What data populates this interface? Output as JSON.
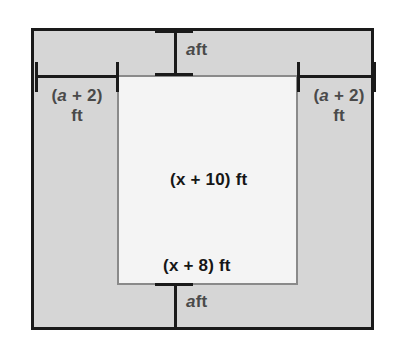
{
  "figure": {
    "colors": {
      "outer_fill": "#d6d6d6",
      "outer_border": "#1a1a1a",
      "inner_fill": "#f4f4f4",
      "inner_border": "#8a8a8a",
      "dimension_line": "#1a1a1a",
      "outer_label_text": "#4a4a4a",
      "inner_label_text": "#161616",
      "page_background": "#ffffff"
    },
    "labels": {
      "top_border": {
        "var": "a",
        "unit": "ft"
      },
      "bottom_border": {
        "var": "a",
        "unit": "ft"
      },
      "left_border": {
        "expr": "(a + 2)",
        "expr_open": "(",
        "expr_var": "a",
        "expr_rest": " + 2)",
        "unit": "ft"
      },
      "right_border": {
        "expr": "(a + 2)",
        "expr_open": "(",
        "expr_var": "a",
        "expr_rest": " + 2)",
        "unit": "ft"
      },
      "inner_height": {
        "open": "(",
        "var": "x",
        "rest": " + 10)",
        "unit": "ft",
        "full": "(x + 10) ft"
      },
      "inner_width": {
        "open": "(",
        "var": "x",
        "rest": " + 8)",
        "unit": "ft",
        "full": "(x + 8) ft"
      }
    },
    "dimensions": [
      {
        "name": "top-border-dimension",
        "orientation": "vertical",
        "label": "a ft"
      },
      {
        "name": "bottom-border-dimension",
        "orientation": "vertical",
        "label": "a ft"
      },
      {
        "name": "left-border-dimension",
        "orientation": "horizontal",
        "label": "(a + 2) ft"
      },
      {
        "name": "right-border-dimension",
        "orientation": "horizontal",
        "label": "(a + 2) ft"
      }
    ]
  }
}
